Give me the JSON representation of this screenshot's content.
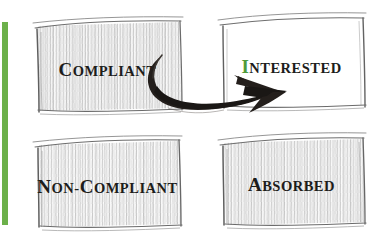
{
  "figure": {
    "type": "sketch-diagram-2x2",
    "background_color": "#ffffff",
    "accent_color": "#6cb04a",
    "ink_color": "#1d1d1b",
    "hatch_color": "#b9b9b9"
  },
  "accent_bar": {
    "name": "left-green-accent-bar",
    "color": "#6cb04a"
  },
  "quadrants": [
    {
      "id": "compliant",
      "position": "top-left",
      "filled": true,
      "lead_letter": "C",
      "rest_letters": "OMPLIANT",
      "label_full": "COMPLIANT",
      "lead_accent": false
    },
    {
      "id": "interested",
      "position": "top-right",
      "filled": false,
      "lead_letter": "I",
      "rest_letters": "NTERESTED",
      "label_full": "INTERESTED",
      "lead_accent": true
    },
    {
      "id": "non-compliant",
      "position": "bottom-left",
      "filled": true,
      "lead_letter": "N",
      "rest_letters": "ON-",
      "lead_letter_2": "C",
      "rest_letters_2": "OMPLIANT",
      "label_full": "NON-COMPLIANT",
      "lead_accent": false
    },
    {
      "id": "absorbed",
      "position": "bottom-right",
      "filled": true,
      "lead_letter": "A",
      "rest_letters": "BSORBED",
      "label_full": "ABSORBED",
      "lead_accent": false
    }
  ],
  "arrow": {
    "name": "curved-transition-arrow",
    "from": "COMPLIANT",
    "to": "INTERESTED",
    "style": "hand-drawn-swoosh",
    "color": "#231f1c"
  }
}
